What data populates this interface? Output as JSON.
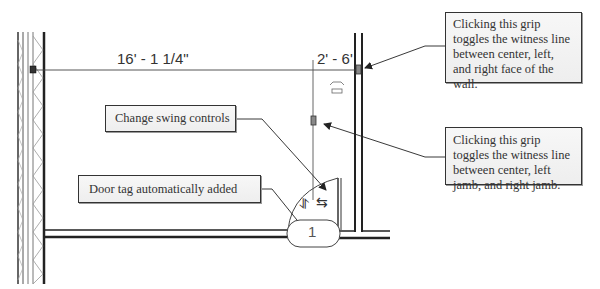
{
  "dimensions": {
    "overall": "16' - 1 1/4\"",
    "door_offset": "2' - 6'"
  },
  "door_tag": {
    "number": "1"
  },
  "callouts": [
    {
      "id": "change-swing",
      "text": "Change swing controls"
    },
    {
      "id": "door-tag",
      "text": "Door tag automatically added"
    },
    {
      "id": "wall-grip",
      "text": "Clicking this grip toggles the witness line between center, left, and right face of the wall."
    },
    {
      "id": "jamb-grip",
      "text": "Clicking this grip toggles the witness line between center, left jamb, and right jamb."
    }
  ],
  "icons": {
    "flip-vertical": "⥯",
    "flip-horizontal": "⇆"
  },
  "colors": {
    "line": "#333333",
    "callout_bg": "#f2f2f2",
    "hatch": "#888888"
  }
}
